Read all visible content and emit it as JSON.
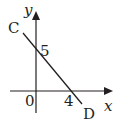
{
  "diagram": {
    "type": "coordinate-axes-with-line",
    "axes": {
      "x_label": "x",
      "y_label": "y",
      "origin_label": "0"
    },
    "line": {
      "start_label": "C",
      "end_label": "D",
      "y_intercept_label": "5",
      "x_intercept_label": "4",
      "y_intercept": 5,
      "x_intercept": 4
    },
    "colors": {
      "stroke": "#231f20",
      "background": "#ffffff"
    }
  }
}
